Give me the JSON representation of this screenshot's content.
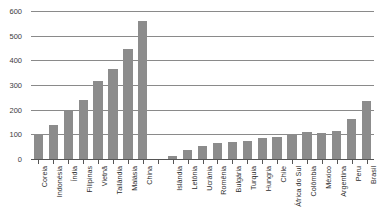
{
  "chart_data": {
    "type": "bar",
    "title": "",
    "subtitle": "",
    "xlabel": "",
    "ylabel": "",
    "ylim": [
      0,
      600
    ],
    "yticks": [
      0,
      100,
      200,
      300,
      400,
      500,
      600
    ],
    "grid": true,
    "legend": null,
    "bar_color": "#8c8c8c",
    "grid_color": "#8a8a8a",
    "axis_color": "#555555",
    "groups": [
      {
        "name": "Asia",
        "categories": [
          "Coreia",
          "Indonésia",
          "Índia",
          "Filipinas",
          "Vietnã",
          "Tailândia",
          "Malásia",
          "China"
        ],
        "values": [
          105,
          140,
          200,
          245,
          320,
          370,
          450,
          565
        ]
      },
      {
        "name": "Europe and others",
        "categories": [
          "Islândia",
          "Letônia",
          "Ucrânia",
          "Romênia",
          "Bulgária",
          "Turquia",
          "Hungria",
          "Chile",
          "África do Sul",
          "Colômbia",
          "México",
          "Argentina",
          "Peru",
          "Brasil"
        ],
        "values": [
          15,
          40,
          58,
          70,
          72,
          78,
          90,
          95,
          105,
          112,
          110,
          118,
          165,
          240
        ]
      }
    ],
    "categories": [
      "Coreia",
      "Indonésia",
      "Índia",
      "Filipinas",
      "Vietnã",
      "Tailândia",
      "Malásia",
      "China",
      "",
      "Islândia",
      "Letônia",
      "Ucrânia",
      "Romênia",
      "Bulgária",
      "Turquia",
      "Hungria",
      "Chile",
      "África do Sul",
      "Colômbia",
      "México",
      "Argentina",
      "Peru",
      "Brasil"
    ],
    "values": [
      105,
      140,
      200,
      245,
      320,
      370,
      450,
      565,
      null,
      15,
      40,
      58,
      70,
      72,
      78,
      90,
      95,
      105,
      112,
      110,
      118,
      165,
      240
    ],
    "ytick_labels": [
      "0",
      "100",
      "200",
      "300",
      "400",
      "500",
      "600"
    ]
  }
}
